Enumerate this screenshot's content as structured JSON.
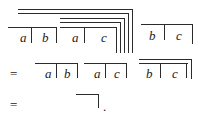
{
  "figure": {
    "kind": "boolean-algebra-overline-derivation",
    "width": 201,
    "height": 123,
    "ink_color": "#2b2b2b",
    "text_color": "#1b1b1b",
    "background_color": "#ffffff",
    "variables": [
      "a",
      "b",
      "c"
    ],
    "operators": [
      "="
    ],
    "punctuation": [
      "."
    ],
    "lines": [
      {
        "id": "line-1",
        "label": "nested complement expression",
        "reading": "complement of ( a-bar b-bar a-bar c-bar ) with several nested bars, followed by b-bar c-bar",
        "tokens": [
          "a",
          "b",
          "a",
          "c",
          "b",
          "c"
        ]
      },
      {
        "id": "line-2",
        "label": "first simplification",
        "reading": "= a-bar b-bar  a-bar c-bar  b-bar c-bar under one bar",
        "tokens": [
          "=",
          "a",
          "b",
          "a",
          "c",
          "b",
          "c"
        ]
      },
      {
        "id": "line-3",
        "label": "final result",
        "reading": "= empty bar .",
        "tokens": [
          "=",
          "."
        ]
      }
    ],
    "strokes": {
      "horizontal": [
        {
          "name": "row1-outer-bar-1",
          "x": 18,
          "y": 9,
          "w": 114
        },
        {
          "name": "row1-outer-bar-2",
          "x": 18,
          "y": 13,
          "w": 110
        },
        {
          "name": "row1-bar-over-ab",
          "x": 8,
          "y": 27,
          "w": 48
        },
        {
          "name": "row1-inner-bar-1",
          "x": 60,
          "y": 18,
          "w": 64
        },
        {
          "name": "row1-inner-bar-2",
          "x": 60,
          "y": 22,
          "w": 60
        },
        {
          "name": "row1-bar-over-ac",
          "x": 60,
          "y": 27,
          "w": 56
        },
        {
          "name": "row1-bar-over-bc",
          "x": 141,
          "y": 24,
          "w": 52
        },
        {
          "name": "row2-outer-bar",
          "x": 139,
          "y": 59,
          "w": 53
        },
        {
          "name": "row2-bar-over-ab",
          "x": 35,
          "y": 63,
          "w": 42
        },
        {
          "name": "row2-bar-over-ac",
          "x": 84,
          "y": 63,
          "w": 42
        },
        {
          "name": "row2-bar-over-bc",
          "x": 139,
          "y": 63,
          "w": 49
        },
        {
          "name": "row3-empty-bar",
          "x": 76,
          "y": 94,
          "w": 23
        }
      ],
      "vertical": [
        {
          "name": "row1-outer-tick-1",
          "x": 132,
          "y": 9,
          "h": 44
        },
        {
          "name": "row1-outer-tick-2",
          "x": 128,
          "y": 13,
          "h": 40
        },
        {
          "name": "row1-inner-tick-1",
          "x": 124,
          "y": 18,
          "h": 35
        },
        {
          "name": "row1-inner-tick-2",
          "x": 120,
          "y": 22,
          "h": 31
        },
        {
          "name": "row1-tick-after-c",
          "x": 116,
          "y": 27,
          "h": 26
        },
        {
          "name": "row1-tick-after-a1",
          "x": 31,
          "y": 27,
          "h": 16
        },
        {
          "name": "row1-tick-after-b",
          "x": 56,
          "y": 27,
          "h": 16
        },
        {
          "name": "row1-tick-after-a2",
          "x": 84,
          "y": 27,
          "h": 16
        },
        {
          "name": "row1-tick-after-b2",
          "x": 164,
          "y": 24,
          "h": 16
        },
        {
          "name": "row1-tick-after-c2",
          "x": 192,
          "y": 24,
          "h": 20
        },
        {
          "name": "row2-tick-after-a1",
          "x": 56,
          "y": 63,
          "h": 15
        },
        {
          "name": "row2-tick-after-b1",
          "x": 77,
          "y": 63,
          "h": 15
        },
        {
          "name": "row2-tick-after-a2",
          "x": 105,
          "y": 63,
          "h": 15
        },
        {
          "name": "row2-tick-after-c1",
          "x": 126,
          "y": 63,
          "h": 15
        },
        {
          "name": "row2-tick-after-b2",
          "x": 160,
          "y": 63,
          "h": 15
        },
        {
          "name": "row2-tick-after-c2",
          "x": 186,
          "y": 63,
          "h": 15
        },
        {
          "name": "row2-outer-tick",
          "x": 191,
          "y": 59,
          "h": 20
        },
        {
          "name": "row3-empty-tick",
          "x": 98,
          "y": 94,
          "h": 14
        }
      ]
    },
    "glyphs": [
      {
        "name": "row1-var-a-1",
        "text": "a",
        "x": 20,
        "y": 31
      },
      {
        "name": "row1-var-b-1",
        "text": "b",
        "x": 42,
        "y": 31
      },
      {
        "name": "row1-var-a-2",
        "text": "a",
        "x": 72,
        "y": 31
      },
      {
        "name": "row1-var-c-1",
        "text": "c",
        "x": 101,
        "y": 31
      },
      {
        "name": "row1-var-b-2",
        "text": "b",
        "x": 149,
        "y": 29
      },
      {
        "name": "row1-var-c-2",
        "text": "c",
        "x": 176,
        "y": 29
      },
      {
        "name": "row2-equals",
        "text": "=",
        "x": 10,
        "y": 67,
        "role": "op"
      },
      {
        "name": "row2-var-a-1",
        "text": "a",
        "x": 45,
        "y": 67
      },
      {
        "name": "row2-var-b-1",
        "text": "b",
        "x": 64,
        "y": 67
      },
      {
        "name": "row2-var-a-2",
        "text": "a",
        "x": 94,
        "y": 67
      },
      {
        "name": "row2-var-c-1",
        "text": "c",
        "x": 114,
        "y": 67
      },
      {
        "name": "row2-var-b-2",
        "text": "b",
        "x": 146,
        "y": 67
      },
      {
        "name": "row2-var-c-2",
        "text": "c",
        "x": 172,
        "y": 67
      },
      {
        "name": "row3-equals",
        "text": "=",
        "x": 10,
        "y": 98,
        "role": "op"
      },
      {
        "name": "row3-period",
        "text": ".",
        "x": 103,
        "y": 100,
        "role": "punct"
      }
    ]
  }
}
